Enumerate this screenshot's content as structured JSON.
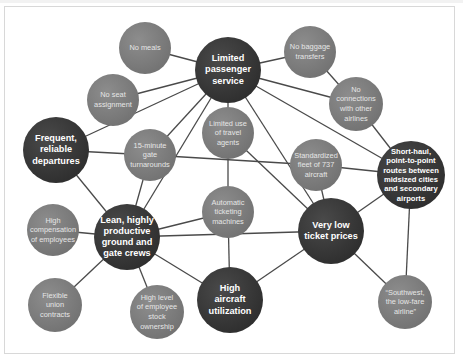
{
  "diagram": {
    "colors": {
      "dark_node": "#333333",
      "light_node": "#7c7c7c",
      "edge": "#4a4a4a",
      "frame_border": "#d8d8d8"
    },
    "nodes": [
      {
        "id": "limited-passenger-service",
        "label": "Limited\npassenger\nservice",
        "kind": "dark",
        "x": 228,
        "y": 70,
        "r": 33
      },
      {
        "id": "no-meals",
        "label": "No meals",
        "kind": "light",
        "x": 145,
        "y": 48,
        "r": 26
      },
      {
        "id": "no-baggage-transfers",
        "label": "No baggage\ntransfers",
        "kind": "light",
        "x": 310,
        "y": 52,
        "r": 26
      },
      {
        "id": "no-seat-assignment",
        "label": "No seat\nassignment",
        "kind": "light",
        "x": 113,
        "y": 100,
        "r": 26
      },
      {
        "id": "no-connections",
        "label": "No\nconnections\nwith other\nairlines",
        "kind": "light",
        "x": 356,
        "y": 104,
        "r": 27
      },
      {
        "id": "frequent-reliable-departures",
        "label": "Frequent,\nreliable\ndepartures",
        "kind": "dark",
        "x": 56,
        "y": 150,
        "r": 33
      },
      {
        "id": "gate-turnarounds",
        "label": "15-minute\ngate\nturnarounds",
        "kind": "light",
        "x": 150,
        "y": 155,
        "r": 26
      },
      {
        "id": "limited-travel-agents",
        "label": "Limited use\nof travel\nagents",
        "kind": "light",
        "x": 228,
        "y": 133,
        "r": 26
      },
      {
        "id": "standardized-fleet",
        "label": "Standardized\nfleet of 737\naircraft",
        "kind": "light",
        "x": 316,
        "y": 165,
        "r": 26
      },
      {
        "id": "short-haul-routes",
        "label": "Short-haul,\npoint-to-point\nroutes between\nmidsized cities\nand secondary\nairports",
        "kind": "dark",
        "small": true,
        "x": 411,
        "y": 175,
        "r": 34
      },
      {
        "id": "automatic-ticketing",
        "label": "Automatic\nticketing\nmachines",
        "kind": "light",
        "x": 228,
        "y": 212,
        "r": 26
      },
      {
        "id": "lean-crews",
        "label": "Lean, highly\nproductive\nground and\ngate crews",
        "kind": "dark",
        "x": 127,
        "y": 237,
        "r": 33
      },
      {
        "id": "very-low-ticket-prices",
        "label": "Very low\nticket prices",
        "kind": "dark",
        "x": 331,
        "y": 231,
        "r": 33
      },
      {
        "id": "high-compensation",
        "label": "High\ncompensation\nof employees",
        "kind": "light",
        "x": 53,
        "y": 230,
        "r": 26
      },
      {
        "id": "high-aircraft-utilization",
        "label": "High\naircraft\nutilization",
        "kind": "dark",
        "x": 230,
        "y": 300,
        "r": 33
      },
      {
        "id": "flexible-union-contracts",
        "label": "Flexible\nunion\ncontracts",
        "kind": "light",
        "x": 55,
        "y": 305,
        "r": 27
      },
      {
        "id": "employee-stock-ownership",
        "label": "High level\nof employee\nstock\nownership",
        "kind": "light",
        "x": 157,
        "y": 312,
        "r": 27
      },
      {
        "id": "southwest-low-fare",
        "label": "“Southwest,\nthe low-fare\nairline”",
        "kind": "light",
        "x": 405,
        "y": 302,
        "r": 27
      }
    ],
    "edges": [
      [
        "limited-passenger-service",
        "no-meals"
      ],
      [
        "limited-passenger-service",
        "no-baggage-transfers"
      ],
      [
        "limited-passenger-service",
        "no-seat-assignment"
      ],
      [
        "limited-passenger-service",
        "no-connections"
      ],
      [
        "limited-passenger-service",
        "frequent-reliable-departures"
      ],
      [
        "limited-passenger-service",
        "gate-turnarounds"
      ],
      [
        "limited-passenger-service",
        "limited-travel-agents"
      ],
      [
        "limited-passenger-service",
        "lean-crews"
      ],
      [
        "limited-passenger-service",
        "very-low-ticket-prices"
      ],
      [
        "limited-passenger-service",
        "short-haul-routes"
      ],
      [
        "no-baggage-transfers",
        "no-connections"
      ],
      [
        "no-connections",
        "short-haul-routes"
      ],
      [
        "frequent-reliable-departures",
        "gate-turnarounds"
      ],
      [
        "frequent-reliable-departures",
        "lean-crews"
      ],
      [
        "gate-turnarounds",
        "standardized-fleet"
      ],
      [
        "gate-turnarounds",
        "lean-crews"
      ],
      [
        "limited-travel-agents",
        "automatic-ticketing"
      ],
      [
        "limited-travel-agents",
        "very-low-ticket-prices"
      ],
      [
        "standardized-fleet",
        "short-haul-routes"
      ],
      [
        "standardized-fleet",
        "very-low-ticket-prices"
      ],
      [
        "short-haul-routes",
        "very-low-ticket-prices"
      ],
      [
        "short-haul-routes",
        "southwest-low-fare"
      ],
      [
        "automatic-ticketing",
        "lean-crews"
      ],
      [
        "automatic-ticketing",
        "high-aircraft-utilization"
      ],
      [
        "lean-crews",
        "very-low-ticket-prices"
      ],
      [
        "lean-crews",
        "high-compensation"
      ],
      [
        "lean-crews",
        "flexible-union-contracts"
      ],
      [
        "lean-crews",
        "employee-stock-ownership"
      ],
      [
        "lean-crews",
        "high-aircraft-utilization"
      ],
      [
        "very-low-ticket-prices",
        "high-aircraft-utilization"
      ],
      [
        "very-low-ticket-prices",
        "southwest-low-fare"
      ]
    ]
  }
}
